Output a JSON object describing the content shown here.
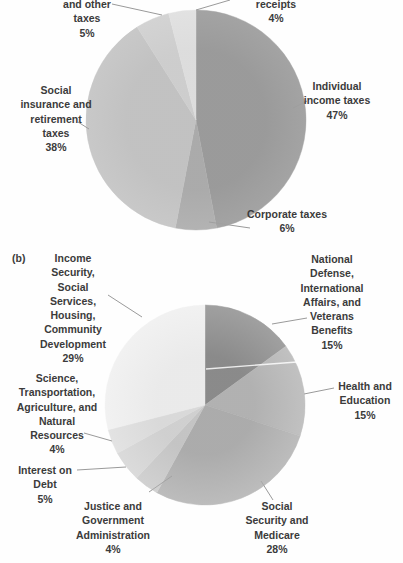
{
  "panels": {
    "b_label": "(b)"
  },
  "colors": {
    "background": "#fefefe",
    "text": "#3b3b3b",
    "leader_line": "#9a9a9a",
    "artifact_line": "#ffffff"
  },
  "chart_data": [
    {
      "id": "a",
      "type": "pie",
      "title": "",
      "legend": "none",
      "start_angle_deg": 0,
      "direction": "clockwise",
      "slices": [
        {
          "label_lines": [
            "Individual",
            "income taxes"
          ],
          "pct_label": "47%",
          "value": 47,
          "color": "#9d9d9d"
        },
        {
          "label_lines": [
            "Corporate taxes"
          ],
          "pct_label": "6%",
          "value": 6,
          "color": "#aeaeae"
        },
        {
          "label_lines": [
            "Social",
            "insurance and",
            "retirement",
            "taxes"
          ],
          "pct_label": "38%",
          "value": 38,
          "color": "#c6c6c6"
        },
        {
          "label_lines": [
            "and other",
            "taxes"
          ],
          "pct_label": "5%",
          "value": 5,
          "color": "#d2d2d2"
        },
        {
          "label_lines": [
            "receipts"
          ],
          "pct_label": "4%",
          "value": 4,
          "color": "#e2e2e2"
        }
      ]
    },
    {
      "id": "b",
      "type": "pie",
      "title": "",
      "legend": "none",
      "start_angle_deg": 0,
      "direction": "clockwise",
      "slices": [
        {
          "label_lines": [
            "National",
            "Defense,",
            "International",
            "Affairs, and",
            "Veterans",
            "Benefits"
          ],
          "pct_label": "15%",
          "value": 15,
          "color": "#8e8e8e"
        },
        {
          "label_lines": [
            "Health and",
            "Education"
          ],
          "pct_label": "15%",
          "value": 15,
          "color": "#b7b7b7"
        },
        {
          "label_lines": [
            "Social",
            "Security and",
            "Medicare"
          ],
          "pct_label": "28%",
          "value": 28,
          "color": "#b1b1b1"
        },
        {
          "label_lines": [
            "Justice and",
            "Government",
            "Administration"
          ],
          "pct_label": "4%",
          "value": 4,
          "color": "#cbcbcb"
        },
        {
          "label_lines": [
            "Interest on",
            "Debt"
          ],
          "pct_label": "5%",
          "value": 5,
          "color": "#d7d7d7"
        },
        {
          "label_lines": [
            "Science,",
            "Transportation,",
            "Agriculture, and",
            "Natural",
            "Resources"
          ],
          "pct_label": "4%",
          "value": 4,
          "color": "#e1e1e1"
        },
        {
          "label_lines": [
            "Income",
            "Security,",
            "Social",
            "Services,",
            "Housing,",
            "Community",
            "Development"
          ],
          "pct_label": "29%",
          "value": 29,
          "color": "#f3f3f3"
        }
      ]
    }
  ]
}
